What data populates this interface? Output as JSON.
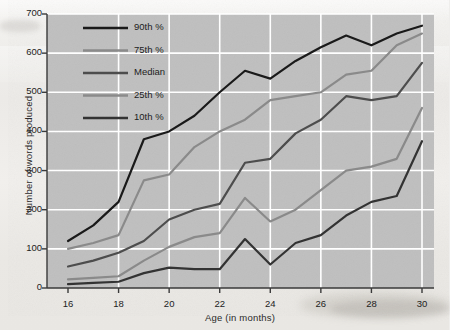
{
  "chart_data": {
    "type": "line",
    "title": "",
    "xlabel": "Age (in months)",
    "ylabel": "Number of words produced",
    "xlim": [
      16,
      30
    ],
    "ylim": [
      0,
      700
    ],
    "xticks": [
      16,
      18,
      20,
      22,
      24,
      26,
      28,
      30
    ],
    "yticks": [
      0,
      100,
      200,
      300,
      400,
      500,
      600,
      700
    ],
    "grid": true,
    "legend_position": "upper-left-inside",
    "x": [
      16,
      17,
      18,
      19,
      20,
      21,
      22,
      23,
      24,
      25,
      26,
      27,
      28,
      29,
      30
    ],
    "series": [
      {
        "name": "90th %",
        "color": "#1a1a1a",
        "values": [
          120,
          160,
          220,
          380,
          400,
          440,
          500,
          555,
          535,
          580,
          615,
          645,
          620,
          650,
          670
        ]
      },
      {
        "name": "75th %",
        "color": "#8a8a8a",
        "values": [
          100,
          115,
          135,
          275,
          290,
          360,
          400,
          430,
          480,
          490,
          500,
          545,
          555,
          620,
          650
        ]
      },
      {
        "name": "Median",
        "color": "#4d4d4d",
        "values": [
          55,
          70,
          90,
          120,
          175,
          200,
          215,
          320,
          330,
          395,
          430,
          490,
          480,
          490,
          575
        ]
      },
      {
        "name": "25th %",
        "color": "#8a8a8a",
        "values": [
          22,
          26,
          30,
          70,
          105,
          130,
          140,
          230,
          170,
          200,
          250,
          300,
          310,
          330,
          460
        ]
      },
      {
        "name": "10th %",
        "color": "#333333",
        "values": [
          10,
          13,
          16,
          38,
          52,
          48,
          48,
          125,
          60,
          115,
          135,
          185,
          220,
          235,
          375
        ]
      }
    ]
  },
  "legend": {
    "items": [
      {
        "label": "90th %"
      },
      {
        "label": "75th %"
      },
      {
        "label": "Median"
      },
      {
        "label": "25th %"
      },
      {
        "label": "10th %"
      }
    ]
  },
  "plot_style": {
    "plot_background": "#bfbfbf",
    "gridline_color": "#ffffff",
    "axis_color": "#3a3a3a",
    "page_background": "#efeeec"
  }
}
